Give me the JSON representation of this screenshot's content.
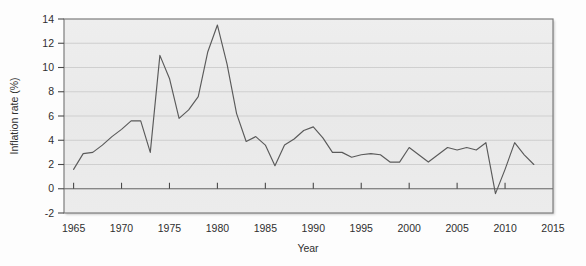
{
  "chart_data": {
    "type": "line",
    "title": "",
    "xlabel": "Year",
    "ylabel": "Inflation rate (%)",
    "xlim": [
      1964,
      2015
    ],
    "ylim": [
      -2,
      14
    ],
    "xticks": [
      1965,
      1970,
      1975,
      1980,
      1985,
      1990,
      1995,
      2000,
      2005,
      2010,
      2015
    ],
    "yticks": [
      -2,
      0,
      2,
      4,
      6,
      8,
      10,
      12,
      14
    ],
    "xtick_labels": [
      "1965",
      "1970",
      "1975",
      "1980",
      "1985",
      "1990",
      "1995",
      "2000",
      "2005",
      "2010",
      "2015"
    ],
    "ytick_labels": [
      "-2",
      "0",
      "2",
      "4",
      "6",
      "8",
      "10",
      "12",
      "14"
    ],
    "grid": true,
    "grid_axis": "y",
    "legend": false,
    "legend_position": "none",
    "line_color": "#5a5a5a",
    "background_color": "#ececec",
    "frame_color": "#808080",
    "gridline_color": "#c8c8c8",
    "series": [
      {
        "name": "Inflation rate",
        "x": [
          1965,
          1966,
          1967,
          1968,
          1969,
          1970,
          1971,
          1972,
          1973,
          1974,
          1975,
          1976,
          1977,
          1978,
          1979,
          1980,
          1981,
          1982,
          1983,
          1984,
          1985,
          1986,
          1987,
          1988,
          1989,
          1990,
          1991,
          1992,
          1993,
          1994,
          1995,
          1996,
          1997,
          1998,
          1999,
          2000,
          2001,
          2002,
          2003,
          2004,
          2005,
          2006,
          2007,
          2008,
          2009,
          2010,
          2011,
          2012,
          2013
        ],
        "values": [
          1.6,
          2.9,
          3.0,
          3.6,
          4.3,
          4.9,
          5.6,
          5.6,
          3.0,
          11.0,
          9.1,
          5.8,
          6.5,
          7.6,
          11.3,
          13.5,
          10.3,
          6.2,
          3.9,
          4.3,
          3.6,
          1.9,
          3.6,
          4.1,
          4.8,
          5.1,
          4.2,
          3.0,
          3.0,
          2.6,
          2.8,
          2.9,
          2.8,
          2.2,
          2.2,
          3.4,
          2.8,
          2.2,
          2.8,
          3.4,
          3.2,
          3.4,
          3.2,
          3.8,
          -0.4,
          1.6,
          3.8,
          2.8,
          2.0
        ]
      }
    ]
  },
  "axis_titles": {
    "x": "Year",
    "y": "Inflation rate (%)"
  }
}
